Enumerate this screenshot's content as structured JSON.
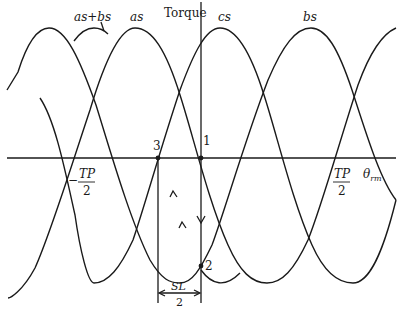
{
  "diagram": {
    "vertical_axis_label": "Torque",
    "horizontal_axis_label": "θ",
    "horizontal_axis_subscript": "rm",
    "curve_labels": {
      "as_plus_bs": "as+bs",
      "as": "as",
      "cs": "cs",
      "bs": "bs"
    },
    "tick_labels": {
      "neg_half_tooth_pitch_num": "TP",
      "neg_half_tooth_pitch_den": "2",
      "neg_sign": "−",
      "pos_half_tooth_pitch_num": "TP",
      "pos_half_tooth_pitch_den": "2"
    },
    "points": {
      "p1": "1",
      "p2": "2",
      "p3": "3"
    },
    "dimension": {
      "num": "SL",
      "den": "2"
    }
  }
}
